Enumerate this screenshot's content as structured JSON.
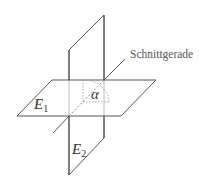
{
  "labels": {
    "line": "Schnittgerade",
    "angle": "α",
    "plane1": {
      "base": "E",
      "sub": "1"
    },
    "plane2": {
      "base": "E",
      "sub": "2"
    }
  },
  "colors": {
    "stroke": "#555555",
    "dashed": "#aaaaaa",
    "text": "#333333"
  }
}
